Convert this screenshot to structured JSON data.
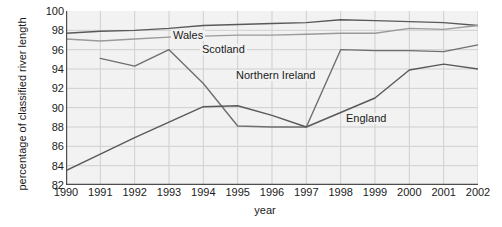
{
  "chart_data": {
    "type": "line",
    "title": "",
    "xlabel": "year",
    "ylabel": "percentage of classified river length",
    "categories": [
      1990,
      1991,
      1992,
      1993,
      1994,
      1995,
      1996,
      1997,
      1998,
      1999,
      2000,
      2001,
      2002
    ],
    "x": [
      "1990",
      "1991",
      "1992",
      "1993",
      "1994",
      "1995",
      "1996",
      "1997",
      "1998",
      "1999",
      "2000",
      "2001",
      "2002"
    ],
    "xlim": [
      1990,
      2002
    ],
    "ylim": [
      82,
      100
    ],
    "yticks": [
      100,
      98,
      96,
      94,
      92,
      90,
      88,
      86,
      84,
      82
    ],
    "ytick_labels": [
      "100",
      "98",
      "96",
      "94",
      "92",
      "90",
      "88",
      "86",
      "84",
      "82"
    ],
    "grid": true,
    "legend_position": "inline-labels",
    "series": [
      {
        "name": "Wales",
        "color": "#595959",
        "label_x": 171,
        "label_y": 30,
        "values": [
          97.7,
          97.9,
          98.0,
          98.2,
          98.5,
          98.6,
          98.7,
          98.8,
          99.1,
          99.0,
          98.9,
          98.8,
          98.5
        ]
      },
      {
        "name": "Scotland",
        "color": "#9a9a9a",
        "label_x": 200,
        "label_y": 44,
        "values": [
          97.1,
          96.9,
          97.1,
          97.3,
          97.4,
          97.5,
          97.5,
          97.6,
          97.7,
          97.7,
          98.2,
          98.1,
          98.5
        ]
      },
      {
        "name": "Northern Ireland",
        "color": "#6e6e6e",
        "label_x": 234,
        "label_y": 70,
        "values": [
          null,
          95.1,
          94.3,
          96.0,
          92.5,
          88.1,
          88.0,
          88.0,
          96.0,
          95.9,
          95.9,
          95.8,
          96.5
        ]
      },
      {
        "name": "England",
        "color": "#595959",
        "label_x": 344,
        "label_y": 113,
        "values": [
          83.5,
          85.2,
          86.9,
          88.5,
          90.1,
          90.2,
          89.2,
          88.0,
          89.5,
          91.0,
          93.9,
          94.5,
          94.0
        ]
      }
    ],
    "notes": {
      "northern_ireland_start_year": "1991",
      "northern_ireland_no_1990_data": "true"
    }
  },
  "axes": {
    "x_title": "year",
    "y_title": "percentage of classified river length"
  },
  "colors": {
    "plot_background": "#f2f2f2",
    "page_background": "#ffffff",
    "grid": "#cfcfcf",
    "axis": "#4d4d4d",
    "text": "#1a1a1a"
  }
}
